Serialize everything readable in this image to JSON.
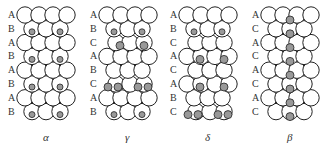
{
  "panels": [
    {
      "id": "alpha",
      "label": "α",
      "stacking": [
        "A",
        "B",
        "A",
        "B",
        "A",
        "B",
        "A",
        "B"
      ],
      "interstitials": [
        [
          1,
          "a"
        ],
        [
          3,
          "a"
        ],
        [
          5,
          "a"
        ],
        [
          7,
          "a"
        ]
      ]
    },
    {
      "id": "gamma",
      "label": "γ",
      "stacking": [
        "A",
        "B",
        "C",
        "A",
        "B",
        "C",
        "A",
        "B"
      ],
      "interstitials": [
        [
          1,
          "a"
        ],
        [
          2,
          "b"
        ],
        [
          5,
          "c"
        ],
        [
          7,
          "a"
        ]
      ]
    },
    {
      "id": "delta",
      "label": "δ",
      "stacking": [
        "A",
        "B",
        "C",
        "A",
        "C",
        "A",
        "B",
        "C"
      ],
      "interstitials": [
        [
          1,
          "a"
        ],
        [
          3,
          "b"
        ],
        [
          5,
          "b"
        ],
        [
          7,
          "c"
        ]
      ]
    },
    {
      "id": "beta",
      "label": "β",
      "stacking": [
        "A",
        "C",
        "A",
        "C",
        "A",
        "C",
        "A",
        "C"
      ],
      "interstitials": [
        [
          0,
          "m"
        ],
        [
          1,
          "m"
        ],
        [
          2,
          "m"
        ],
        [
          3,
          "m"
        ],
        [
          4,
          "m"
        ],
        [
          5,
          "m"
        ],
        [
          6,
          "m"
        ],
        [
          7,
          "m"
        ]
      ]
    }
  ],
  "colors": {
    "atom_fill": "#ffffff",
    "atom_stroke": "#222222",
    "interstitial_fill": "#999999"
  }
}
